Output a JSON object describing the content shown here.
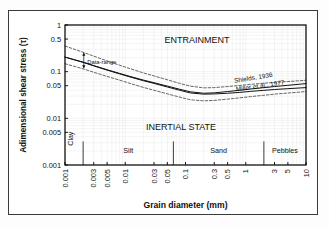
{
  "figure": {
    "background": "#ffffff",
    "frame_color": "#000000",
    "grid_color": "#e2e2e2"
  },
  "chart_data": {
    "type": "line",
    "title": "",
    "xlabel": "Grain diameter (mm)",
    "ylabel": "Adimensional shear stress (τ)",
    "xscale": "log",
    "yscale": "log",
    "xlim": [
      0.001,
      10
    ],
    "ylim": [
      0.001,
      1
    ],
    "grid": true,
    "legend": "inline-annotations",
    "xticks": [
      "0.001",
      "0.003",
      "0.005",
      "0.01",
      "0.03",
      "0.05",
      "0.1",
      "0.3",
      "0.5",
      "1",
      "3",
      "5",
      "10"
    ],
    "xtick_values": [
      0.001,
      0.003,
      0.005,
      0.01,
      0.03,
      0.05,
      0.1,
      0.3,
      0.5,
      1,
      3,
      5,
      10
    ],
    "yticks": [
      "1",
      "0.5",
      "0.1",
      "0.05",
      "0.01",
      "0.005",
      "0.001"
    ],
    "ytick_values": [
      1,
      0.5,
      0.1,
      0.05,
      0.01,
      0.005,
      0.001
    ],
    "series": [
      {
        "name": "Shields, 1936",
        "style": "solid",
        "color": "#111111",
        "label_x": 1.35,
        "label_y": 0.062,
        "label_rotation": -9,
        "x": [
          0.001,
          0.002,
          0.003,
          0.005,
          0.008,
          0.012,
          0.02,
          0.03,
          0.05,
          0.08,
          0.12,
          0.2,
          0.3,
          0.5,
          0.8,
          1.2,
          2,
          3,
          5,
          8,
          10
        ],
        "y": [
          0.205,
          0.16,
          0.135,
          0.11,
          0.092,
          0.079,
          0.066,
          0.058,
          0.049,
          0.042,
          0.037,
          0.0345,
          0.0352,
          0.0375,
          0.04,
          0.0425,
          0.0455,
          0.048,
          0.051,
          0.054,
          0.0555
        ]
      },
      {
        "name": "Miller et al., 1977",
        "style": "solid",
        "color": "#111111",
        "label_x": 1.75,
        "label_y": 0.0415,
        "label_rotation": -8,
        "x": [
          0.001,
          0.002,
          0.003,
          0.005,
          0.008,
          0.012,
          0.02,
          0.03,
          0.05,
          0.08,
          0.12,
          0.2,
          0.3,
          0.5,
          0.8,
          1.2,
          2,
          3,
          5,
          8,
          10
        ],
        "y": [
          0.205,
          0.158,
          0.133,
          0.108,
          0.09,
          0.077,
          0.064,
          0.056,
          0.047,
          0.04,
          0.035,
          0.033,
          0.0333,
          0.0345,
          0.036,
          0.0378,
          0.0398,
          0.0415,
          0.0432,
          0.0448,
          0.0455
        ]
      },
      {
        "name": "Data-range upper envelope",
        "style": "dashed",
        "color": "#333333",
        "x": [
          0.001,
          0.002,
          0.003,
          0.005,
          0.008,
          0.012,
          0.02,
          0.03,
          0.05,
          0.08,
          0.12,
          0.2,
          0.3,
          0.5,
          0.8,
          1.2,
          2,
          3,
          5,
          8,
          10
        ],
        "y": [
          0.355,
          0.26,
          0.215,
          0.17,
          0.138,
          0.116,
          0.094,
          0.081,
          0.067,
          0.056,
          0.049,
          0.045,
          0.0455,
          0.048,
          0.0508,
          0.0535,
          0.0565,
          0.059,
          0.0615,
          0.064,
          0.0655
        ]
      },
      {
        "name": "Data-range lower envelope",
        "style": "dashed",
        "color": "#333333",
        "x": [
          0.001,
          0.002,
          0.003,
          0.005,
          0.008,
          0.012,
          0.02,
          0.03,
          0.05,
          0.08,
          0.12,
          0.2,
          0.3,
          0.5,
          0.8,
          1.2,
          2,
          3,
          5,
          8,
          10
        ],
        "y": [
          0.148,
          0.115,
          0.097,
          0.079,
          0.066,
          0.056,
          0.046,
          0.04,
          0.0335,
          0.0285,
          0.025,
          0.0237,
          0.0242,
          0.0258,
          0.0275,
          0.0292,
          0.0312,
          0.033,
          0.0348,
          0.0365,
          0.0375
        ]
      }
    ],
    "annotations": [
      {
        "name": "entrainment",
        "text": "ENTRAINMENT",
        "x": 0.045,
        "y": 0.42
      },
      {
        "name": "inertial-state",
        "text": "INERTIAL STATE",
        "x": 0.022,
        "y": 0.0055
      },
      {
        "name": "data-range",
        "text": "Data-range",
        "x": 0.00235,
        "y": 0.148
      }
    ],
    "classes": [
      {
        "label": "Clay",
        "from": 0.001,
        "to": 0.002
      },
      {
        "label": "Silt",
        "from": 0.002,
        "to": 0.063
      },
      {
        "label": "Sand",
        "from": 0.063,
        "to": 2.0
      },
      {
        "label": "Pebbles",
        "from": 2.0,
        "to": 10.0
      }
    ]
  }
}
